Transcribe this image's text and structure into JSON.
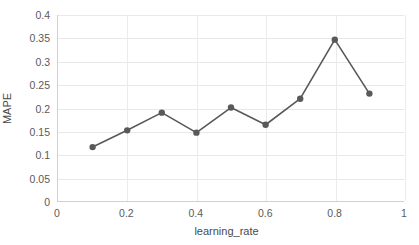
{
  "chart_data": {
    "type": "line",
    "title": "",
    "xlabel": "learning_rate",
    "ylabel": "MAPE",
    "x": [
      0.1,
      0.2,
      0.3,
      0.4,
      0.5,
      0.6,
      0.7,
      0.8,
      0.9
    ],
    "values": [
      0.116,
      0.152,
      0.19,
      0.147,
      0.201,
      0.164,
      0.22,
      0.347,
      0.231
    ],
    "series": [
      {
        "name": "MAPE",
        "values": [
          0.116,
          0.152,
          0.19,
          0.147,
          0.201,
          0.164,
          0.22,
          0.347,
          0.231
        ]
      }
    ],
    "xlim": [
      0,
      1
    ],
    "ylim": [
      0,
      0.4
    ],
    "xticks": [
      0,
      0.2,
      0.4,
      0.6,
      0.8,
      1
    ],
    "xtick_labels": [
      "0",
      "0.2",
      "0.4",
      "0.6",
      "0.8",
      "1"
    ],
    "yticks": [
      0,
      0.05,
      0.1,
      0.15,
      0.2,
      0.25,
      0.3,
      0.35,
      0.4
    ],
    "ytick_labels": [
      "0",
      "0.05",
      "0.1",
      "0.15",
      "0.2",
      "0.25",
      "0.3",
      "0.35",
      "0.4"
    ],
    "grid": {
      "horizontal": true,
      "vertical": true
    },
    "legend": {
      "visible": false,
      "position": "none"
    },
    "style": {
      "line_color": "#595959",
      "marker_color": "#595959",
      "marker_shape": "circle",
      "marker_size": 5,
      "line_width": 1.6,
      "grid_color": "#e8e8e8",
      "axis_color": "#d0d0d0",
      "tick_label_color": "#5a5a5a",
      "axis_title_color": "#4a4a4a",
      "background": "#ffffff"
    }
  }
}
